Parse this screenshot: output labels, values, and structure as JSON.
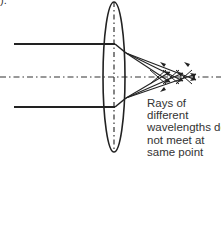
{
  "figure": {
    "label": ").",
    "caption_lines": [
      "Rays of",
      "different",
      "wavelengths do",
      "not meet at",
      "same point"
    ]
  },
  "diagram": {
    "type": "chromatic-aberration",
    "colors": {
      "stroke": "#222222",
      "axis": "#333333",
      "text": "#333333"
    },
    "lens": {
      "cx": 114,
      "cy": 77,
      "rx": 11,
      "ry": 76
    },
    "principal_axis_y": 77,
    "incoming_rays_y": [
      44,
      107
    ],
    "focal_points_x": [
      162,
      175,
      188
    ]
  }
}
